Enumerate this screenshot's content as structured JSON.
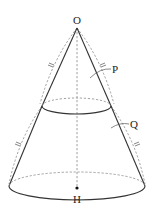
{
  "diagram": {
    "type": "geometry-figure",
    "labels": {
      "apex": "O",
      "upper_solid": "P",
      "lower_solid": "Q",
      "base_center": "H"
    },
    "equal_marks": "‖",
    "colors": {
      "solid_line": "#333333",
      "dashed_line": "#888888",
      "text": "#222222",
      "background": "#ffffff"
    }
  }
}
